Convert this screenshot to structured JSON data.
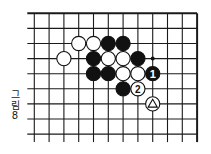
{
  "diagram": {
    "caption": [
      "그",
      "림",
      "8"
    ],
    "board": {
      "cols": 12,
      "rows": 9,
      "origin_x": 34.3,
      "origin_y": 13.3,
      "spacing_x": 14.8,
      "spacing_y": 15.1,
      "edges": {
        "top": true,
        "right": true,
        "left": false,
        "bottom": false
      },
      "line_color": "#1a1a1a"
    },
    "stones": [
      {
        "color": "white",
        "col": 3,
        "row": 2
      },
      {
        "color": "white",
        "col": 4,
        "row": 2
      },
      {
        "color": "black",
        "col": 5,
        "row": 2
      },
      {
        "color": "black",
        "col": 6,
        "row": 2
      },
      {
        "color": "white",
        "col": 2,
        "row": 3
      },
      {
        "color": "black",
        "col": 4,
        "row": 3
      },
      {
        "color": "white",
        "col": 5,
        "row": 3
      },
      {
        "color": "white",
        "col": 6,
        "row": 3
      },
      {
        "color": "black",
        "col": 7,
        "row": 3
      },
      {
        "color": "black",
        "col": 4,
        "row": 4
      },
      {
        "color": "black",
        "col": 5,
        "row": 4
      },
      {
        "color": "white",
        "col": 6,
        "row": 4
      },
      {
        "color": "white",
        "col": 7,
        "row": 4
      },
      {
        "color": "black",
        "col": 8,
        "row": 4,
        "label": "1"
      },
      {
        "color": "black",
        "col": 6,
        "row": 5
      },
      {
        "color": "white",
        "col": 7,
        "row": 5,
        "label": "2"
      },
      {
        "color": "white",
        "col": 8,
        "row": 6,
        "mark": "triangle"
      }
    ],
    "markers": [
      {
        "type": "dot",
        "col": 8,
        "row": 3
      }
    ]
  }
}
